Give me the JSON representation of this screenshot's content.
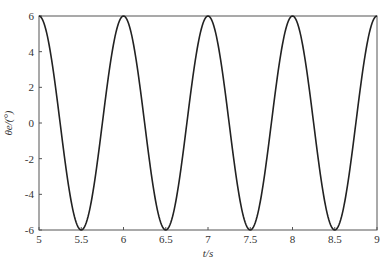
{
  "chart_data": {
    "type": "line",
    "title": "",
    "xlabel": "t/s",
    "ylabel": "θe/(°)",
    "xlim": [
      5,
      9
    ],
    "ylim": [
      -6,
      6
    ],
    "x_ticks": [
      5,
      5.5,
      6,
      6.5,
      7,
      7.5,
      8,
      8.5,
      9
    ],
    "x_tick_labels": [
      "5",
      "5.5",
      "6",
      "6.5",
      "7",
      "7.5",
      "8",
      "8.5",
      "9"
    ],
    "y_ticks": [
      -6,
      -4,
      -2,
      0,
      2,
      4,
      6
    ],
    "y_tick_labels": [
      "-6",
      "-4",
      "-2",
      "0",
      "2",
      "4",
      "6"
    ],
    "grid": false,
    "legend": null,
    "series": [
      {
        "name": "θe",
        "function": "6*cos(2*pi*t)",
        "color": "#222222",
        "x": [
          5,
          5.25,
          5.5,
          5.75,
          6,
          6.25,
          6.5,
          6.75,
          7,
          7.25,
          7.5,
          7.75,
          8,
          8.25,
          8.5,
          8.75,
          9
        ],
        "values": [
          6,
          0,
          -6,
          0,
          6,
          0,
          -6,
          0,
          6,
          0,
          -6,
          0,
          6,
          0,
          -6,
          0,
          6
        ]
      }
    ]
  },
  "plot": {
    "left": 39,
    "right": 377,
    "top": 16,
    "bottom": 230,
    "frame_color": "#555555",
    "line_color": "#222222"
  }
}
